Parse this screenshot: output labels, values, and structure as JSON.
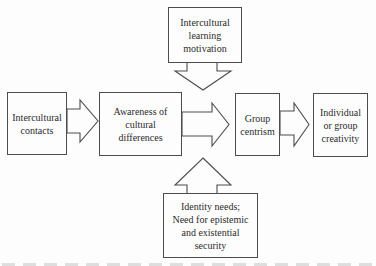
{
  "diagram": {
    "boxes": {
      "intercultural_learning_motivation": {
        "text": "Intercultural\nlearning\nmotivation"
      },
      "intercultural_contacts": {
        "text": "Intercultural\ncontacts"
      },
      "awareness_of_cultural_differences": {
        "text": "Awareness of\ncultural\ndifferences"
      },
      "group_centrism": {
        "text": "Group\ncentrism"
      },
      "individual_or_group_creativity": {
        "text": "Individual\nor group\ncreativity"
      },
      "identity_needs": {
        "text": "Identity needs;\nNeed for epistemic\nand existential\nsecurity"
      }
    },
    "connections": [
      {
        "from": "Intercultural contacts",
        "to": "Awareness of cultural differences",
        "style": "hollow-block-arrow",
        "direction": "right"
      },
      {
        "from": "Awareness of cultural differences",
        "to": "Group centrism",
        "style": "hollow-block-arrow",
        "direction": "right"
      },
      {
        "from": "Group centrism",
        "to": "Individual or group creativity",
        "style": "hollow-block-arrow",
        "direction": "right"
      },
      {
        "from": "Intercultural learning motivation",
        "to": "center link between Awareness of cultural differences and Group centrism",
        "style": "hollow-block-arrow",
        "direction": "down"
      },
      {
        "from": "Identity needs; Need for epistemic and existential security",
        "to": "center link between Awareness of cultural differences and Group centrism",
        "style": "hollow-block-arrow",
        "direction": "up"
      }
    ],
    "colors": {
      "line": "#4c4c4c",
      "text": "#2b2b2b",
      "background": "#fdfdfd"
    }
  }
}
